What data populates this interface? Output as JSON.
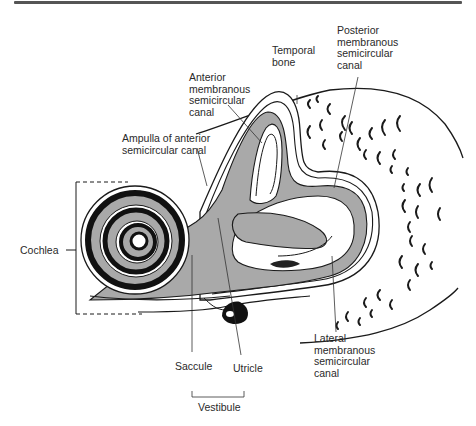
{
  "figure": {
    "colors": {
      "fill_gray": "#a9a9a9",
      "stroke": "#1a1a1a",
      "cochlea_dark": "#111111",
      "background": "#ffffff"
    }
  },
  "labels": {
    "temporal_bone": "Temporal\nbone",
    "posterior_canal": "Posterior\nmembranous\nsemicircular\ncanal",
    "anterior_canal": "Anterior\nmembranous\nsemicircular\ncanal",
    "ampulla": "Ampulla of anterior\nsemicircular canal",
    "cochlea": "Cochlea",
    "saccule": "Saccule",
    "utricle": "Utricle",
    "vestibule": "Vestibule",
    "lateral_canal": "Lateral\nmembranous\nsemicircular\ncanal"
  }
}
